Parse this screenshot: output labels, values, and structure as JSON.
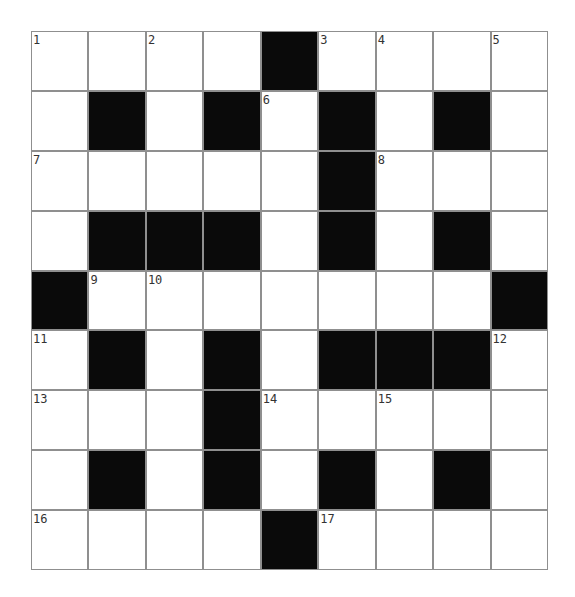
{
  "puzzle": {
    "rows": 9,
    "cols": 9,
    "colors": {
      "block": "#0a0a0a",
      "empty": "#ffffff",
      "gridline": "#8f8f8f",
      "number": "#333333"
    },
    "grid": [
      [
        "1",
        "",
        "2",
        "",
        "#",
        "3",
        "4",
        "",
        "5"
      ],
      [
        "",
        "#",
        "",
        "#",
        "6",
        "#",
        "",
        "#",
        ""
      ],
      [
        "7",
        "",
        "",
        "",
        "",
        "#",
        "8",
        "",
        ""
      ],
      [
        "",
        "#",
        "#",
        "#",
        "",
        "#",
        "",
        "#",
        ""
      ],
      [
        "#",
        "9",
        "10",
        "",
        "",
        "",
        "",
        "",
        "#"
      ],
      [
        "11",
        "#",
        "",
        "#",
        "",
        "#",
        "#",
        "#",
        "12"
      ],
      [
        "13",
        "",
        "",
        "#",
        "14",
        "",
        "15",
        "",
        ""
      ],
      [
        "",
        "#",
        "",
        "#",
        "",
        "#",
        "",
        "#",
        ""
      ],
      [
        "16",
        "",
        "",
        "",
        "#",
        "17",
        "",
        "",
        ""
      ]
    ]
  }
}
